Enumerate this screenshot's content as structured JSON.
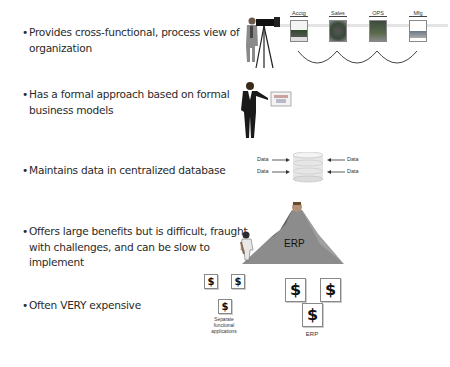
{
  "bullets": [
    {
      "lines": [
        "Provides cross-functional, process view of",
        "organization"
      ]
    },
    {
      "lines": [
        "Has a formal approach based on formal",
        "business models"
      ]
    },
    {
      "lines": [
        "Maintains data in centralized database"
      ]
    },
    {
      "lines": [
        "Offers large benefits but is difficult, fraught",
        "with challenges, and can be slow to",
        "implement"
      ]
    },
    {
      "lines": [
        "Often VERY expensive"
      ]
    }
  ],
  "bullet_symbol": "•",
  "process_view": {
    "departments": [
      "Acctg",
      "Sales",
      "OPS",
      "Mfg"
    ],
    "icons": [
      "camera-operator-icon",
      "department-photo-icon"
    ]
  },
  "business_model": {
    "icons": [
      "presenter-man-icon",
      "chart-board-icon"
    ]
  },
  "database": {
    "labels": {
      "left_top": "Data",
      "left_bottom": "Data",
      "right_top": "Data",
      "right_bottom": "Data"
    },
    "icon": "database-cylinder-icon"
  },
  "mountain": {
    "label": "ERP",
    "icons": [
      "climber-icon",
      "mountain-icon",
      "summit-figure-icon"
    ]
  },
  "cost": {
    "symbol": "$",
    "separate_label_lines": [
      "Separate",
      "functional",
      "applications"
    ],
    "erp_label": "ERP"
  },
  "colors": {
    "text": "#2a2a2a",
    "mountain": "#8c8c8c",
    "line": "#555555"
  }
}
